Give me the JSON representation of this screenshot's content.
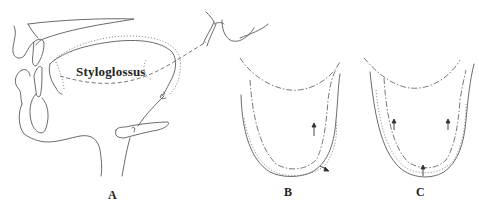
{
  "figure": {
    "muscle_label": "Styloglossus",
    "panels": [
      {
        "id": "A",
        "label": "A",
        "description": "sagittal view of tongue with styloglossus line of action"
      },
      {
        "id": "B",
        "label": "B",
        "description": "coronal tongue outline with contraction arrows"
      },
      {
        "id": "C",
        "label": "C",
        "description": "coronal tongue outline with upward arrows"
      }
    ],
    "line_styles": {
      "solid": "resting outline",
      "dotted": "displaced outline",
      "dash-dot": "muscle / contracted outline"
    },
    "colors": {
      "background": "#ffffff",
      "ink": "#5a5a5a",
      "label": "#222222"
    }
  }
}
